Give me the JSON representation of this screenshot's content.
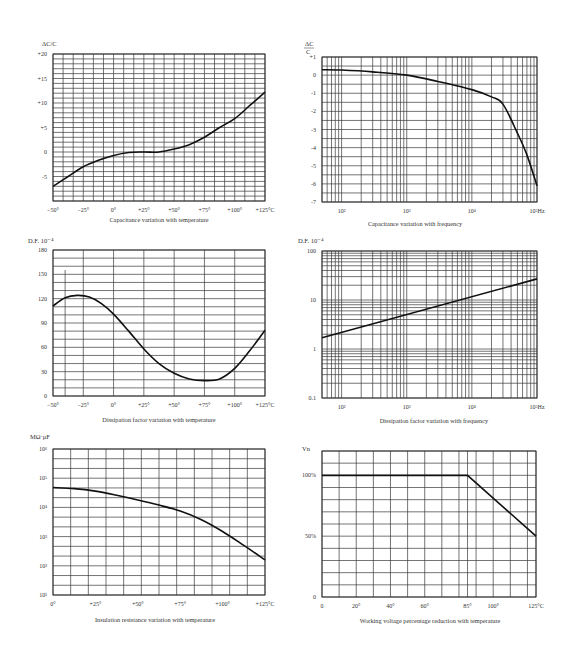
{
  "chart_data": [
    {
      "id": "c1",
      "type": "line",
      "title": "Capacitance variation with temperature",
      "ylabel": "ΔC/C %",
      "xlabel": "Temperature (°C)",
      "x_ticks": [
        "−50°",
        "−25°",
        "0°",
        "+25°",
        "+50°",
        "+75°",
        "+100°",
        "+125°C"
      ],
      "y_ticks": [
        "+20",
        "+15",
        "+10",
        "+5",
        "0",
        "-5"
      ],
      "xlim": [
        -50,
        125
      ],
      "ylim": [
        -10,
        20
      ],
      "grid": true,
      "x": [
        -50,
        -37.5,
        -25,
        -12.5,
        0,
        12.5,
        25,
        37.5,
        50,
        62.5,
        75,
        87.5,
        100,
        112.5,
        125
      ],
      "y": [
        -7,
        -5,
        -3,
        -1.7,
        -0.7,
        -0.1,
        0,
        0,
        0.6,
        1.5,
        3,
        5,
        6.8,
        9.5,
        12.2
      ]
    },
    {
      "id": "c2",
      "type": "line",
      "title": "Capacitance variation with frequency",
      "ylabel": "ΔC/C",
      "xlabel": "Frequency (Hz)",
      "x_scale": "log",
      "x_ticks": [
        "10²",
        "10³",
        "10⁴",
        "10⁵Hz"
      ],
      "y_ticks": [
        "+1",
        "0",
        "-1",
        "-2",
        "-3",
        "-4",
        "-5",
        "-6",
        "-7"
      ],
      "xlim": [
        50,
        100000
      ],
      "ylim": [
        -7,
        1
      ],
      "grid": true,
      "x": [
        50,
        100,
        300,
        1000,
        3000,
        10000,
        20000,
        30000,
        50000,
        70000,
        100000
      ],
      "y": [
        0.3,
        0.28,
        0.18,
        0.0,
        -0.35,
        -0.8,
        -1.2,
        -1.6,
        -3.2,
        -4.4,
        -6.1
      ]
    },
    {
      "id": "c3",
      "type": "line",
      "title": "Dissipation factor variation with temperature",
      "ylabel": "D.F. 10⁻⁴",
      "xlabel": "Temperature (°C)",
      "x_ticks": [
        "−50°",
        "−25°",
        "0°",
        "+25°",
        "+50°",
        "+75°",
        "+100°",
        "+125°C"
      ],
      "y_ticks": [
        "180",
        "150",
        "120",
        "90",
        "60",
        "30",
        "0"
      ],
      "xlim": [
        -50,
        125
      ],
      "ylim": [
        0,
        180
      ],
      "grid": true,
      "x": [
        -50,
        -40,
        -30,
        -20,
        -10,
        0,
        12.5,
        25,
        37.5,
        50,
        62.5,
        75,
        87.5,
        100,
        112.5,
        125
      ],
      "y": [
        111,
        121,
        124,
        122,
        114,
        101,
        80,
        58,
        40,
        28,
        21,
        19,
        21,
        34,
        56,
        81
      ]
    },
    {
      "id": "c4",
      "type": "line",
      "title": "Dissipation factor variation with frequency",
      "ylabel": "D.F. 10⁻⁴",
      "xlabel": "Frequency (Hz)",
      "x_scale": "log",
      "y_scale": "log",
      "x_ticks": [
        "10²",
        "10³",
        "10⁴",
        "10⁵Hz"
      ],
      "y_ticks": [
        "100",
        "10",
        "1",
        "0.1"
      ],
      "xlim": [
        50,
        100000
      ],
      "ylim": [
        0.1,
        100
      ],
      "grid": true,
      "x": [
        50,
        100000
      ],
      "y": [
        1.7,
        27
      ]
    },
    {
      "id": "c5",
      "type": "line",
      "title": "Insulation resistance variation with temperature",
      "ylabel": "MΩ·μF",
      "xlabel": "Temperature (°C)",
      "y_scale": "log",
      "x_ticks": [
        "0°",
        "+25°",
        "+50°",
        "+75°",
        "+100°",
        "+125°C"
      ],
      "y_ticks": [
        "10⁶",
        "10⁵",
        "10⁴",
        "10³",
        "10²",
        "10¹"
      ],
      "xlim": [
        0,
        125
      ],
      "ylim": [
        10,
        1000000
      ],
      "grid": true,
      "x": [
        0,
        12.5,
        25,
        37.5,
        50,
        62.5,
        75,
        87.5,
        100,
        112.5,
        125
      ],
      "y": [
        48000,
        44000,
        36000,
        26000,
        18000,
        12000,
        7500,
        3800,
        1500,
        500,
        160
      ]
    },
    {
      "id": "c6",
      "type": "line",
      "title": "Working voltage percentage reduction with temperature",
      "ylabel": "Vn",
      "xlabel": "Temperature (°C)",
      "x_ticks": [
        "0",
        "20°",
        "40°",
        "60°",
        "85°",
        "100°",
        "125°C"
      ],
      "x_tick_values": [
        0,
        20,
        40,
        60,
        85,
        100,
        125
      ],
      "y_ticks": [
        "100%",
        "50%",
        "0"
      ],
      "xlim": [
        0,
        125
      ],
      "ylim": [
        0,
        120
      ],
      "grid": true,
      "x": [
        0,
        85,
        125
      ],
      "y": [
        100,
        100,
        50
      ]
    }
  ],
  "labels": {
    "c1": {
      "ylabel": "ΔC/C",
      "caption": "Capacitance variation with temperature"
    },
    "c2": {
      "ylabel_num": "ΔC",
      "ylabel_den": "C",
      "caption": "Capacitance variation with frequency"
    },
    "c3": {
      "ylabel": "D.F. 10⁻⁴",
      "caption": "Dissipation factor variation with temperature"
    },
    "c4": {
      "ylabel": "D.F. 10⁻⁴",
      "caption": "Dissipation factor variation with frequency"
    },
    "c5": {
      "ylabel": "MΩ·μF",
      "caption": "Insulation resistance variation with temperature"
    },
    "c6": {
      "ylabel": "Vn",
      "caption": "Working voltage percentage reduction with temperature"
    }
  }
}
